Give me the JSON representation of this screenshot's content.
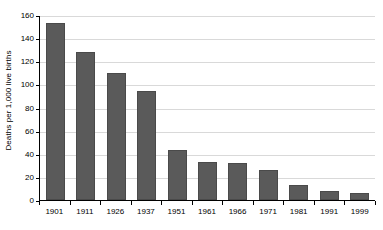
{
  "chart_data": {
    "type": "bar",
    "title": "",
    "subtitle": "",
    "xlabel": "",
    "ylabel": "Deaths per 1,000 live births",
    "categories": [
      "1901",
      "1911",
      "1926",
      "1937",
      "1951",
      "1961",
      "1966",
      "1971",
      "1981",
      "1991",
      "1999"
    ],
    "values": [
      153,
      128,
      110,
      94,
      43,
      33,
      32,
      26,
      13,
      8,
      6
    ],
    "ylim": [
      0,
      160
    ],
    "ytick_values": [
      0,
      20,
      40,
      60,
      80,
      100,
      120,
      140,
      160
    ],
    "ytick_labels": [
      "0",
      "20",
      "40",
      "60",
      "80",
      "100",
      "120",
      "140",
      "160"
    ],
    "grid": "horizontal",
    "legend": "none",
    "bar_color": "#5a5a5a",
    "gridline_color": "#d9d9d9",
    "axis_color": "#000000",
    "background_color": "#ffffff",
    "annotations": []
  }
}
